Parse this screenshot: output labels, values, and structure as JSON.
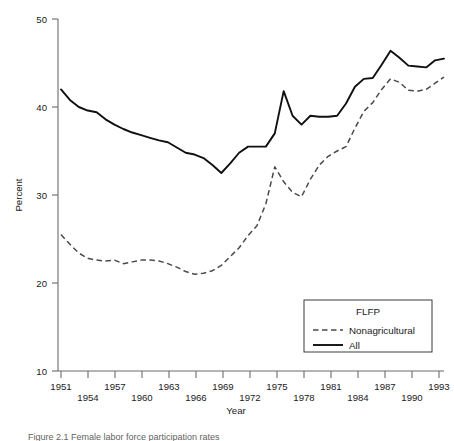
{
  "chart_data": {
    "type": "line",
    "title": "",
    "xlabel": "Year",
    "ylabel": "Percent",
    "xlim": [
      1951,
      1994
    ],
    "ylim": [
      10,
      50
    ],
    "grid": false,
    "legend_position": "bottom-right",
    "legend_title": "FLFP",
    "y_ticks": [
      10,
      20,
      30,
      40,
      50
    ],
    "y_tick_labels": [
      "10",
      "20",
      "30",
      "40",
      "50"
    ],
    "x_ticks": [
      1951,
      1954,
      1957,
      1960,
      1963,
      1966,
      1969,
      1972,
      1975,
      1978,
      1981,
      1984,
      1987,
      1990,
      1993
    ],
    "x_tick_labels_row1": [
      "1951",
      "1957",
      "1963",
      "1969",
      "1975",
      "1981",
      "1987",
      "1993"
    ],
    "x_tick_labels_row2": [
      "1954",
      "1960",
      "1966",
      "1972",
      "1978",
      "1984",
      "1990"
    ],
    "x": [
      1951,
      1952,
      1953,
      1954,
      1955,
      1956,
      1957,
      1958,
      1959,
      1960,
      1961,
      1962,
      1963,
      1964,
      1965,
      1966,
      1967,
      1968,
      1969,
      1970,
      1971,
      1972,
      1973,
      1974,
      1975,
      1976,
      1977,
      1978,
      1979,
      1980,
      1981,
      1982,
      1983,
      1984,
      1985,
      1986,
      1987,
      1988,
      1989,
      1990,
      1991,
      1992,
      1993,
      1994
    ],
    "series": [
      {
        "name": "All",
        "style": "solid",
        "color": "#101010",
        "values": [
          42.0,
          40.8,
          40.0,
          39.6,
          39.4,
          38.6,
          38.0,
          37.5,
          37.1,
          36.8,
          36.5,
          36.2,
          36.0,
          35.4,
          34.8,
          34.6,
          34.2,
          33.4,
          32.5,
          33.6,
          34.8,
          35.5,
          35.5,
          35.5,
          37.0,
          41.8,
          39.0,
          38.0,
          39.0,
          38.9,
          38.9,
          39.0,
          40.4,
          42.3,
          43.2,
          43.3,
          44.8,
          46.4,
          45.6,
          44.7,
          44.6,
          44.5,
          45.3,
          45.5
        ]
      },
      {
        "name": "Nonagricultural",
        "style": "dashed",
        "color": "#4a4a4a",
        "values": [
          25.5,
          24.4,
          23.4,
          22.8,
          22.6,
          22.5,
          22.6,
          22.2,
          22.4,
          22.6,
          22.6,
          22.5,
          22.2,
          21.8,
          21.3,
          21.0,
          21.1,
          21.4,
          22.0,
          23.0,
          24.0,
          25.4,
          26.5,
          29.0,
          33.2,
          31.5,
          30.3,
          29.8,
          31.8,
          33.4,
          34.4,
          35.0,
          35.5,
          37.6,
          39.5,
          40.5,
          42.0,
          43.2,
          42.8,
          41.9,
          41.8,
          42.0,
          42.7,
          43.4
        ]
      }
    ]
  },
  "caption": {
    "text": "Figure 2.1  Female labor force participation rates"
  }
}
